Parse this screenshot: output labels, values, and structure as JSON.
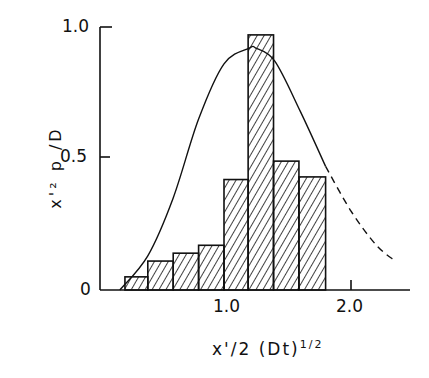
{
  "chart_data": {
    "type": "bar",
    "title": "",
    "xlabel": "x'/2(Dt)^1/2",
    "ylabel": "x'^2 p/D",
    "xlabel_main": "x'/2 (Dt)",
    "xlabel_sup": "1/2",
    "ylabel_text": "x'² p /D",
    "xlim": [
      0,
      2.5
    ],
    "ylim": [
      0,
      1.0
    ],
    "x_ticks": [
      "1.0",
      "2.0"
    ],
    "y_ticks": [
      "0",
      "0.5",
      "1.0"
    ],
    "grid": false,
    "bins": [
      {
        "x0": 0.22,
        "x1": 0.4,
        "value": 0.05
      },
      {
        "x0": 0.4,
        "x1": 0.6,
        "value": 0.11
      },
      {
        "x0": 0.6,
        "x1": 0.8,
        "value": 0.14
      },
      {
        "x0": 0.8,
        "x1": 1.0,
        "value": 0.17
      },
      {
        "x0": 1.0,
        "x1": 1.19,
        "value": 0.42
      },
      {
        "x0": 1.19,
        "x1": 1.39,
        "value": 0.97
      },
      {
        "x0": 1.39,
        "x1": 1.59,
        "value": 0.49
      },
      {
        "x0": 1.59,
        "x1": 1.8,
        "value": 0.43
      }
    ],
    "series": [
      {
        "name": "histogram (hatched bars)",
        "values": [
          0.05,
          0.11,
          0.14,
          0.17,
          0.42,
          0.97,
          0.49,
          0.43
        ]
      },
      {
        "name": "theoretical curve (solid)",
        "x": [
          0.18,
          0.4,
          0.6,
          0.8,
          1.0,
          1.2,
          1.25,
          1.4,
          1.6,
          1.8
        ],
        "y": [
          0.0,
          0.13,
          0.35,
          0.65,
          0.86,
          0.92,
          0.92,
          0.87,
          0.68,
          0.47
        ]
      },
      {
        "name": "theoretical curve extrapolation (dashed)",
        "x": [
          1.8,
          2.0,
          2.2,
          2.35
        ],
        "y": [
          0.47,
          0.3,
          0.17,
          0.11
        ]
      }
    ]
  },
  "axes": {
    "y_tick_labels": {
      "t0": "0",
      "t05": "0.5",
      "t10": "1.0"
    },
    "x_tick_labels": {
      "t1": "1.0",
      "t2": "2.0"
    }
  }
}
